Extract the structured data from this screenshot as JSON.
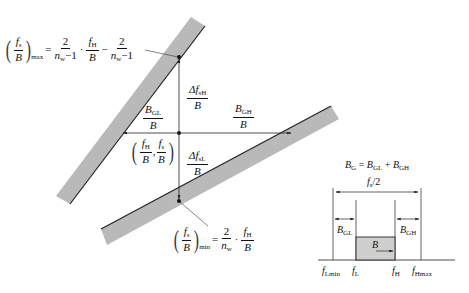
{
  "figure": {
    "type": "frequency-plan diagram (bandpass sampling wedge)",
    "colors": {
      "band_fill": "#b9b9b9",
      "band_edge": "#222222",
      "lines": "#222222",
      "signal_fill": "#cfcfcf"
    }
  },
  "labels": {
    "max_formula": {
      "lhs_num": "f",
      "lhs_num_sub": "s",
      "lhs_den": "B",
      "lhs_sub": "max",
      "equals": "=",
      "t1_num": "2",
      "t1_den": "n",
      "t1_den_sub": "w",
      "t1_den_tail": "−1",
      "dot": "·",
      "t2_num": "f",
      "t2_num_sub": "H",
      "t2_den": "B",
      "minus": "−",
      "t3_num": "2",
      "t3_den": "n",
      "t3_den_sub": "w",
      "t3_den_tail": "−1"
    },
    "min_formula": {
      "lhs_num": "f",
      "lhs_num_sub": "s",
      "lhs_den": "B",
      "lhs_sub": "min",
      "equals": "=",
      "t1_num": "2",
      "t1_den": "n",
      "t1_den_sub": "w",
      "dot": "·",
      "t2_num": "f",
      "t2_num_sub": "H",
      "t2_den": "B"
    },
    "delta_fsH": {
      "num": "Δf",
      "num_sub": "sH",
      "den": "B"
    },
    "delta_fsL": {
      "num": "Δf",
      "num_sub": "sL",
      "den": "B"
    },
    "bgl_ratio": {
      "num": "B",
      "num_sub": "GL",
      "den": "B"
    },
    "bgh_ratio": {
      "num": "B",
      "num_sub": "GH",
      "den": "B"
    },
    "point": {
      "x_num": "f",
      "x_sub": "H",
      "x_den": "B",
      "sep": ",",
      "y_num": "f",
      "y_sub": "s",
      "y_den": "B"
    }
  },
  "inset": {
    "guard_equation": {
      "bg": "B",
      "bg_sub": "G",
      "eq": "=",
      "bgl": "B",
      "bgl_sub": "GL",
      "plus": "+",
      "bgh": "B",
      "bgh_sub": "GH"
    },
    "half_fs": {
      "f": "f",
      "sub": "s",
      "tail": "/2"
    },
    "bgl": {
      "main": "B",
      "sub": "GL"
    },
    "bgh": {
      "main": "B",
      "sub": "GH"
    },
    "b": "B",
    "axis_ticks": [
      {
        "main": "f",
        "sub": "Lmin"
      },
      {
        "main": "f",
        "sub": "L"
      },
      {
        "main": "f",
        "sub": "H"
      },
      {
        "main": "f",
        "sub": "Hmax"
      }
    ]
  }
}
